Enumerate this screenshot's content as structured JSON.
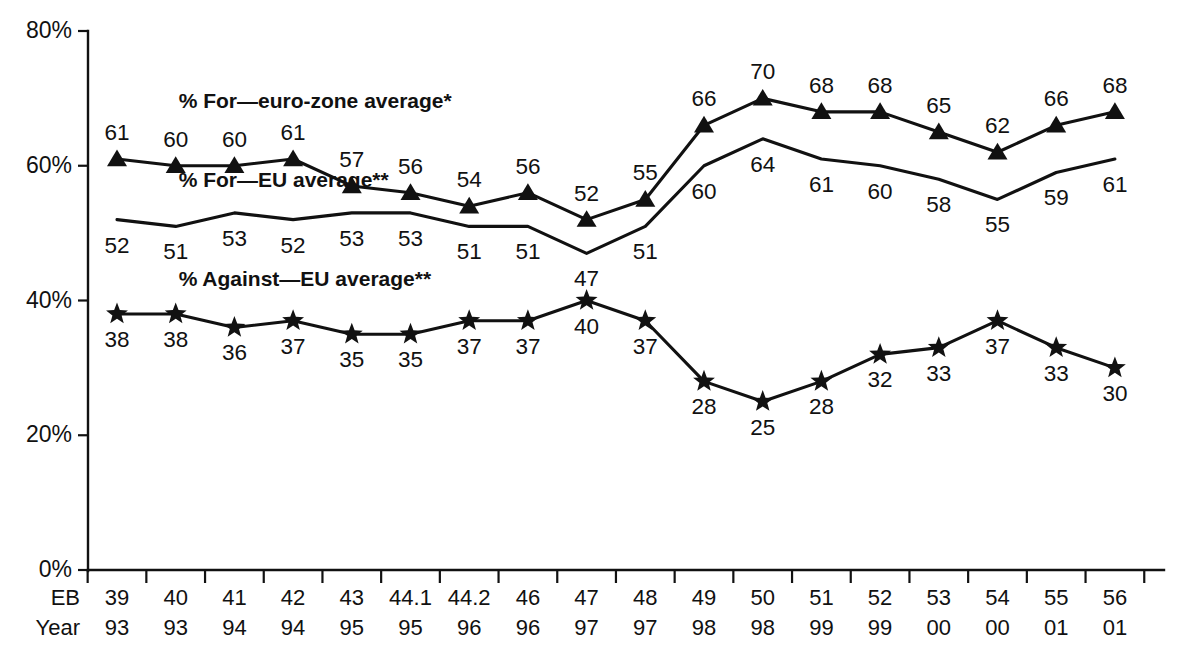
{
  "chart_data": {
    "type": "line",
    "title": "",
    "xlabel": "",
    "ylabel": "",
    "ylim": [
      0,
      80
    ],
    "grid": false,
    "legend_position": "inline-annotations",
    "categories": [
      "39",
      "40",
      "41",
      "42",
      "43",
      "44.1",
      "44.2",
      "46",
      "47",
      "48",
      "49",
      "50",
      "51",
      "52",
      "53",
      "54",
      "55",
      "56"
    ],
    "x_secondary": [
      "93",
      "93",
      "94",
      "94",
      "95",
      "95",
      "96",
      "96",
      "97",
      "97",
      "98",
      "98",
      "99",
      "99",
      "00",
      "00",
      "01",
      "01"
    ],
    "x_row_labels": [
      "EB",
      "Year"
    ],
    "ytick_labels": [
      "0%",
      "20%",
      "40%",
      "60%",
      "80%"
    ],
    "ytick_values": [
      0,
      20,
      40,
      60,
      80
    ],
    "series": [
      {
        "name": "% For—euro-zone average*",
        "marker": "triangle",
        "label_position": "above",
        "values": [
          61,
          60,
          60,
          61,
          57,
          56,
          54,
          56,
          52,
          55,
          66,
          70,
          68,
          68,
          65,
          62,
          66,
          68
        ]
      },
      {
        "name": "% For—EU average**",
        "marker": "none",
        "label_position": "below",
        "values": [
          52,
          51,
          53,
          52,
          53,
          53,
          51,
          51,
          47,
          51,
          60,
          64,
          61,
          60,
          58,
          55,
          59,
          61
        ]
      },
      {
        "name": "% Against—EU average**",
        "marker": "star",
        "label_position": "below",
        "values": [
          38,
          38,
          36,
          37,
          35,
          35,
          37,
          37,
          40,
          37,
          28,
          25,
          28,
          32,
          33,
          37,
          33,
          30
        ]
      }
    ],
    "annotations": [
      {
        "text": "% For—euro-zone average*",
        "x_index": 1.05,
        "y": 68.5
      },
      {
        "text": "% For—EU average**",
        "x_index": 1.05,
        "y": 56.8
      },
      {
        "text": "% Against—EU average**",
        "x_index": 1.05,
        "y": 42.2
      }
    ],
    "footnote": "",
    "colors": {
      "ink": "#111111",
      "background": "#ffffff"
    }
  }
}
